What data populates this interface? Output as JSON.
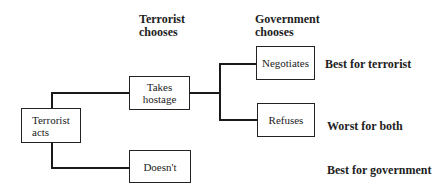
{
  "headers": {
    "terrorist": "Terrorist\nchooses",
    "government": "Government\nchooses"
  },
  "nodes": {
    "root": "Terrorist acts",
    "takes_hostage": "Takes hostage",
    "doesnt": "Doesn't",
    "negotiates": "Negotiates",
    "refuses": "Refuses"
  },
  "outcomes": {
    "negotiates": "Best for terrorist",
    "refuses": "Worst for both",
    "doesnt": "Best for government"
  }
}
